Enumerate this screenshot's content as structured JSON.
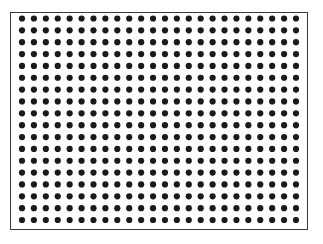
{
  "figure": {
    "type": "dot-grid",
    "rows": 18,
    "columns": 24,
    "dot_color": "#1a1a1a",
    "border_color": "#3a3a3a",
    "background": "#ffffff"
  }
}
